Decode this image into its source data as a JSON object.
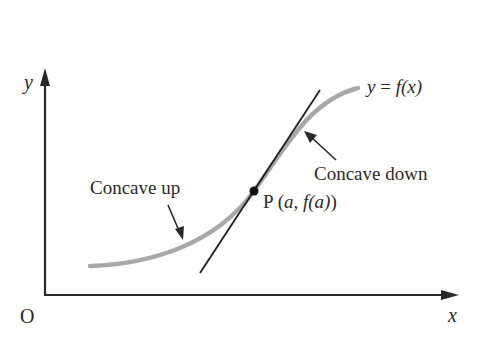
{
  "figure": {
    "axes": {
      "y_label": "y",
      "x_label": "x",
      "origin_label": "O"
    },
    "curve": {
      "label_lhs": "y",
      "label_eq": " = ",
      "label_rhs": "f(x)",
      "color": "#a8a8a8"
    },
    "point": {
      "name": "P",
      "coords_open": " (",
      "coord_a": "a",
      "comma": ", ",
      "coord_fa": "f(a)",
      "coords_close": ")"
    },
    "annotations": {
      "concave_up": "Concave up",
      "concave_down": "Concave down"
    },
    "tangent_line": {
      "color": "#1e1e1e"
    }
  }
}
